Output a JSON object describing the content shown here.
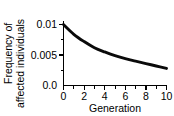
{
  "chart_data": {
    "type": "line",
    "title": "",
    "subtitle": "",
    "xlabel": "Generation",
    "ylabel": "Frequency of affected individuals",
    "ylabel_line1": "Frequency of",
    "ylabel_line2": "affected individuals",
    "xlim": [
      0,
      10
    ],
    "ylim": [
      0,
      0.01
    ],
    "xticks": [
      0,
      2,
      4,
      6,
      8,
      10
    ],
    "xtick_labels": [
      "0",
      "2",
      "4",
      "6",
      "8",
      "10"
    ],
    "yticks": [
      0.0,
      0.005,
      0.01
    ],
    "ytick_labels": [
      "0.0",
      "0.005",
      "0.01"
    ],
    "y_minor_ticks": [
      0.0025,
      0.0075
    ],
    "grid": false,
    "legend": false,
    "legend_position": "none",
    "line_color": "#0a0a0a",
    "background_color": "#ffffff",
    "axis_color": "#000000",
    "x": [
      0,
      1,
      2,
      3,
      4,
      5,
      6,
      7,
      8,
      9,
      10
    ],
    "values": [
      0.01,
      0.0084,
      0.0072,
      0.0062,
      0.0055,
      0.0049,
      0.0044,
      0.004,
      0.0036,
      0.0032,
      0.0028
    ],
    "series": [
      {
        "name": "Frequency of affected individuals",
        "values": [
          0.01,
          0.0084,
          0.0072,
          0.0062,
          0.0055,
          0.0049,
          0.0044,
          0.004,
          0.0036,
          0.0032,
          0.0028
        ]
      }
    ],
    "annotations": []
  }
}
